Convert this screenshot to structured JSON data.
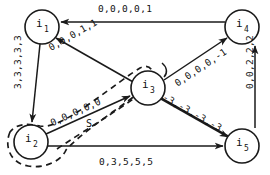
{
  "figure": {
    "type": "directed-graph-diagram",
    "title": "",
    "background_color": "#ffffff",
    "stroke_color": "#1a1a1a"
  },
  "nodes": [
    {
      "id": "i1",
      "label": "i",
      "subscript": "1",
      "cx": 42,
      "cy": 27,
      "r": 17
    },
    {
      "id": "i2",
      "label": "i",
      "subscript": "2",
      "cx": 31,
      "cy": 142,
      "r": 17
    },
    {
      "id": "i3",
      "label": "i",
      "subscript": "3",
      "cx": 148,
      "cy": 88,
      "r": 17
    },
    {
      "id": "i4",
      "label": "i",
      "subscript": "4",
      "cx": 242,
      "cy": 27,
      "r": 17
    },
    {
      "id": "i5",
      "label": "i",
      "subscript": "5",
      "cx": 242,
      "cy": 146,
      "r": 17
    }
  ],
  "edges": [
    {
      "id": "e-i4-i1",
      "from": "i4",
      "to": "i1",
      "label": "0,0,0,0,1",
      "label_rotation": 0,
      "label_x": 98,
      "label_y": 4
    },
    {
      "id": "e-i1-i2",
      "from": "i1",
      "to": "i2",
      "label": "3,3,3,3,3",
      "label_rotation": -90,
      "label_x": 13,
      "label_y": 62
    },
    {
      "id": "e-i5-i1",
      "from": "i5",
      "to": "i1",
      "label": "0,0,0,1,1",
      "label_rotation": 26,
      "label_x": 47,
      "label_y": 44
    },
    {
      "id": "e-i2-i3",
      "from": "i2",
      "to": "i3",
      "label": "0,0,0,0,0",
      "label_rotation": -24.5,
      "label_x": 49,
      "label_y": 118
    },
    {
      "id": "e-i3-i4",
      "from": "i3",
      "to": "i4",
      "label": "0,0,0,0,-1",
      "label_rotation": -26,
      "label_x": 174,
      "label_y": 76
    },
    {
      "id": "e-i4-i5",
      "from": "i4",
      "to": "i5",
      "label": "0,0,2,2,2",
      "label_rotation": -90,
      "label_x": 243,
      "label_y": 62
    },
    {
      "id": "e-i3-i5",
      "from": "i3",
      "to": "i5",
      "label": "-3,-3,-3,-3",
      "label_rotation": 30,
      "label_x": 163,
      "label_y": 92
    },
    {
      "id": "e-i2-i5",
      "from": "i2",
      "to": "i5",
      "label": "0,3,5,5,5",
      "label_rotation": 0,
      "label_x": 99,
      "label_y": 158
    }
  ],
  "regions": [
    {
      "id": "region-s",
      "label": "S",
      "style": "dashed",
      "label_x": 88,
      "label_y": 124,
      "encircles": [
        "i2",
        "i3"
      ]
    }
  ]
}
